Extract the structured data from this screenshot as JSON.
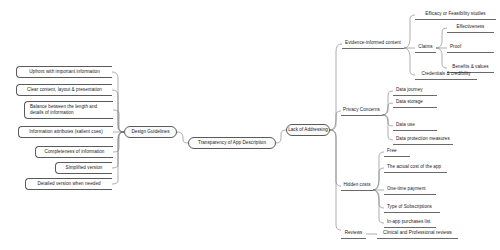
{
  "diagram": {
    "type": "mind-map",
    "title": "Transparency of App Description",
    "center": {
      "label": "Transparency of App Description"
    },
    "left_hub": {
      "label": "Design Guidelines",
      "items": [
        {
          "label": "Upfront with important information"
        },
        {
          "label": "Clear content, layout & presentation"
        },
        {
          "label": "Balance between the length and details of information"
        },
        {
          "label": "Information attributes (salient cues)"
        },
        {
          "label": "Completeness of information"
        },
        {
          "label": "Simplified version"
        },
        {
          "label": "Detailed version when needed"
        }
      ]
    },
    "right_hub": {
      "label": "Lack of Addressing",
      "branches": [
        {
          "label": "Evidence-informed content",
          "items": [
            {
              "label": "Efficacy or Feasibility studies"
            },
            {
              "label": "Claims",
              "items": [
                {
                  "label": "Effectiveness"
                },
                {
                  "label": "Proof"
                },
                {
                  "label": "Benefits & values"
                }
              ]
            },
            {
              "label": "Credentials & credibility"
            }
          ]
        },
        {
          "label": "Privacy Concerns",
          "items": [
            {
              "label": "Data journey"
            },
            {
              "label": "Data storage"
            },
            {
              "label": "Data use"
            },
            {
              "label": "Data protection measures"
            }
          ]
        },
        {
          "label": "Hidden costs",
          "items": [
            {
              "label": "Free"
            },
            {
              "label": "The actual cost of the app"
            },
            {
              "label": "One-time payment"
            },
            {
              "label": "Type of Subscriptions"
            },
            {
              "label": "In-app purchases list"
            }
          ]
        },
        {
          "label": "Reviews",
          "items": [
            {
              "label": "Clinical and Professional reviews"
            }
          ]
        }
      ]
    },
    "colors": {
      "stroke": "#5a5a5a",
      "text": "#1a1a1a",
      "background": "#ffffff"
    }
  }
}
